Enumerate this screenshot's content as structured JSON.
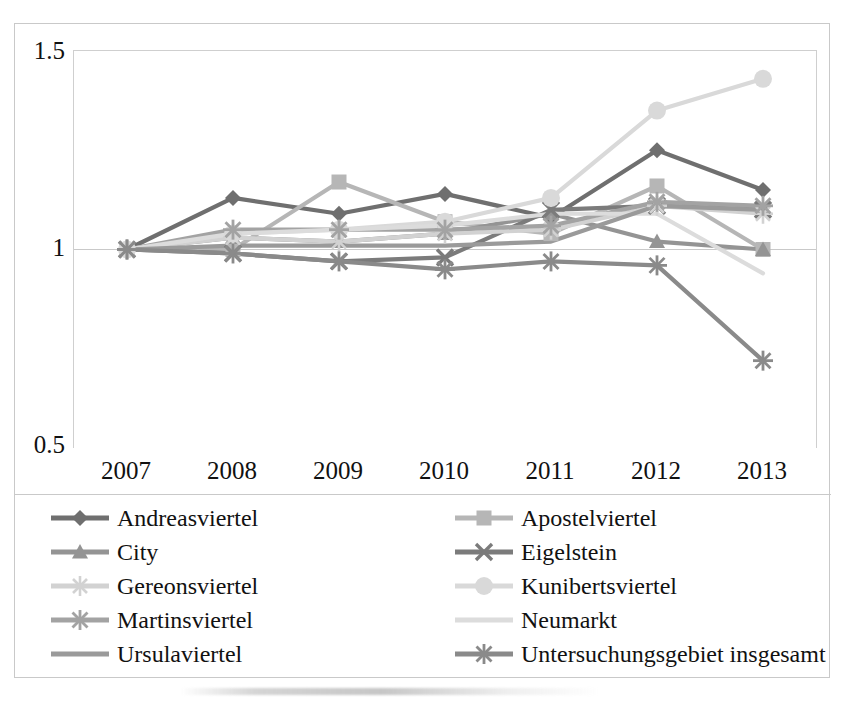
{
  "chart_data": {
    "type": "line",
    "title": "",
    "xlabel": "",
    "ylabel": "",
    "categories": [
      "2007",
      "2008",
      "2009",
      "2010",
      "2011",
      "2012",
      "2013"
    ],
    "ylim": [
      0.5,
      1.5
    ],
    "yticks": [
      "1.5",
      "1",
      "0.5"
    ],
    "ytick_values": [
      1.5,
      1.0,
      0.5
    ],
    "grid": true,
    "legend_position": "bottom",
    "legend_columns": 2,
    "series": [
      {
        "name": "Andreasviertel",
        "marker": "diamond",
        "color": "#6f6f6f",
        "values": [
          1.0,
          1.13,
          1.09,
          1.14,
          1.08,
          1.25,
          1.15
        ]
      },
      {
        "name": "Apostelviertel",
        "marker": "square",
        "color": "#b6b6b6",
        "values": [
          1.0,
          1.0,
          1.17,
          1.07,
          1.04,
          1.16,
          1.0
        ]
      },
      {
        "name": "City",
        "marker": "triangle",
        "color": "#949494",
        "values": [
          1.0,
          1.03,
          1.02,
          1.04,
          1.09,
          1.02,
          1.0
        ]
      },
      {
        "name": "Eigelstein",
        "marker": "cross",
        "color": "#7b7b7b",
        "values": [
          1.0,
          0.99,
          0.97,
          0.98,
          1.1,
          1.11,
          1.1
        ]
      },
      {
        "name": "Gereonsviertel",
        "marker": "star4",
        "color": "#d2d2d2",
        "values": [
          1.0,
          1.03,
          1.02,
          1.04,
          1.05,
          1.11,
          1.09
        ]
      },
      {
        "name": "Kunibertsviertel",
        "marker": "circle",
        "color": "#d9d9d9",
        "values": [
          1.0,
          1.04,
          1.05,
          1.07,
          1.13,
          1.35,
          1.43
        ]
      },
      {
        "name": "Martinsviertel",
        "marker": "star6",
        "color": "#a3a3a3",
        "values": [
          1.0,
          1.05,
          1.05,
          1.05,
          1.06,
          1.12,
          1.11
        ]
      },
      {
        "name": "Neumarkt",
        "marker": "none",
        "color": "#dcdcdc",
        "values": [
          1.0,
          1.04,
          1.05,
          1.06,
          1.09,
          1.09,
          0.94
        ]
      },
      {
        "name": "Ursulaviertel",
        "marker": "none",
        "color": "#9a9a9a",
        "values": [
          1.0,
          1.01,
          1.01,
          1.01,
          1.02,
          1.11,
          1.1
        ]
      },
      {
        "name": "Untersuchungsgebiet insgesamt",
        "marker": "star6",
        "color": "#8a8a8a",
        "values": [
          1.0,
          0.99,
          0.97,
          0.95,
          0.97,
          0.96,
          0.72
        ]
      }
    ]
  },
  "legend": {
    "left_items": [
      {
        "label": "Andreasviertel"
      },
      {
        "label": "City"
      },
      {
        "label": "Gereonsviertel"
      },
      {
        "label": "Martinsviertel"
      },
      {
        "label": "Ursulaviertel"
      }
    ],
    "right_items": [
      {
        "label": "Apostelviertel"
      },
      {
        "label": "Eigelstein"
      },
      {
        "label": "Kunibertsviertel"
      },
      {
        "label": "Neumarkt"
      },
      {
        "label": "Untersuchungsgebiet insgesamt"
      }
    ]
  },
  "colors": {
    "frame": "#c9c9c9",
    "gridline": "#c9c9c9",
    "text": "#111111",
    "background": "#ffffff"
  }
}
